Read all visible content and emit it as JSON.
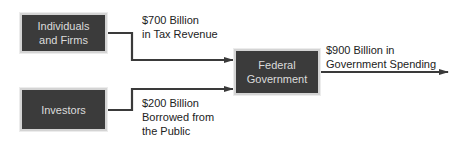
{
  "nodes": {
    "individuals": "Individuals\nand Firms",
    "investors": "Investors",
    "federal": "Federal\nGovernment"
  },
  "flows": {
    "tax": [
      "$700 Billion",
      "in Tax Revenue"
    ],
    "borrowed": [
      "$200 Billion",
      "Borrowed from",
      "the Public"
    ],
    "spending": [
      "$900 Billion in",
      "Government Spending"
    ]
  },
  "colors": {
    "box_fill": "#3b3b3b",
    "box_border": "#d4d4d4",
    "arrow": "#3a3a3a"
  }
}
